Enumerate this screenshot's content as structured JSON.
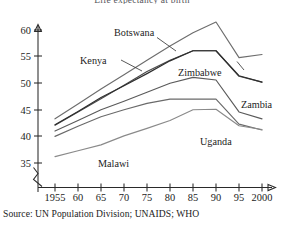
{
  "figure": {
    "title": "Life expectancy at birth",
    "source_note": "Source: UN Population Division; UNAIDS; WHO"
  },
  "axis": {
    "y_ticks": [
      "35",
      "40",
      "45",
      "50",
      "55",
      "60"
    ],
    "x_ticks": [
      "1955",
      "60",
      "65",
      "70",
      "75",
      "80",
      "85",
      "90",
      "95",
      "2000"
    ]
  },
  "labels": {
    "botswana": "Botswana",
    "kenya": "Kenya",
    "zimbabwe": "Zimbabwe",
    "zambia": "Zambia",
    "uganda": "Uganda",
    "malawi": "Malawi"
  },
  "chart_data": {
    "type": "line",
    "title": "Life expectancy at birth",
    "subtitle": "",
    "xlabel": "",
    "ylabel": "Years",
    "source": "Source: UN Population Division; UNAIDS; WHO",
    "x": [
      1955,
      1960,
      1965,
      1970,
      1975,
      1980,
      1985,
      1990,
      1995,
      2000
    ],
    "xlim": [
      1952,
      2002
    ],
    "ylim": [
      34,
      62.5
    ],
    "y_axis_break_below": 35,
    "grid": false,
    "legend": "inline-annotations",
    "units": "years",
    "series": [
      {
        "name": "Botswana",
        "color": "#6d6d6d",
        "values": [
          43.3,
          46.1,
          48.9,
          51.6,
          54.3,
          57.0,
          59.5,
          61.5,
          54.8,
          55.4
        ]
      },
      {
        "name": "Zimbabwe",
        "color": "#4a4a4a",
        "values": [
          42.1,
          44.6,
          47.1,
          49.6,
          52.2,
          54.3,
          56.1,
          56.1,
          51.3,
          50.2
        ]
      },
      {
        "name": "Kenya",
        "color": "#2e2e2e",
        "values": [
          42.2,
          44.7,
          47.3,
          49.5,
          51.8,
          54.2,
          56.1,
          56.1,
          51.4,
          50.2
        ]
      },
      {
        "name": "Zambia",
        "color": "#5a5a5a",
        "values": [
          41.0,
          43.0,
          45.0,
          46.6,
          48.3,
          50.0,
          51.1,
          50.6,
          44.6,
          43.3
        ]
      },
      {
        "name": "Uganda",
        "color": "#6a6a6a",
        "values": [
          40.0,
          41.9,
          43.7,
          45.0,
          46.2,
          47.0,
          47.0,
          47.0,
          42.3,
          41.2
        ]
      },
      {
        "name": "Malawi",
        "color": "#8a8a8a",
        "values": [
          36.2,
          37.3,
          38.4,
          40.1,
          41.5,
          43.0,
          45.0,
          45.1,
          42.0,
          41.3
        ]
      }
    ],
    "annotations": [
      {
        "text": "Botswana",
        "near_x": 1978,
        "near_y": 60.5
      },
      {
        "text": "Kenya",
        "near_x": 1968,
        "near_y": 55.3
      },
      {
        "text": "Zimbabwe",
        "near_x": 1986,
        "near_y": 54.0
      },
      {
        "text": "Zambia",
        "near_x": 1996,
        "near_y": 47.6
      },
      {
        "text": "Uganda",
        "near_x": 1991,
        "near_y": 41.5
      },
      {
        "text": "Malawi",
        "near_x": 1972,
        "near_y": 36.7
      }
    ]
  }
}
